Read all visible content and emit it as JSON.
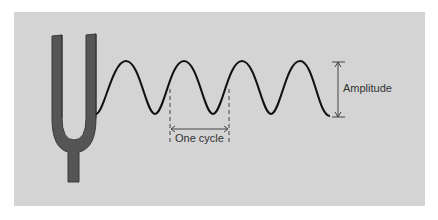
{
  "diagram": {
    "type": "tuning-fork-sound-wave",
    "labels": {
      "amplitude": "Amplitude",
      "cycle": "One cycle"
    },
    "colors": {
      "background": "#d4d4d4",
      "fork": "#555555",
      "fork_edge": "#3a3a3a",
      "wave": "#111111",
      "annotation": "#444444"
    },
    "wave": {
      "cycles": 4,
      "start_x": 96,
      "period_px": 58,
      "peak_y": 61,
      "trough_y": 114
    }
  }
}
